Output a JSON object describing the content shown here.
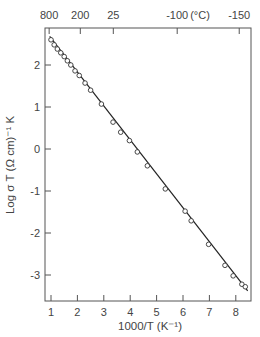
{
  "chart_data": {
    "type": "scatter",
    "title": "",
    "xlabel": "1000/T (K⁻¹)",
    "ylabel": "Log σ T (Ω cm)⁻¹ K",
    "top_xlabel_unit": "(°C)",
    "xlim": [
      0.8,
      8.6
    ],
    "ylim": [
      -3.7,
      2.9
    ],
    "grid": false,
    "legend": null,
    "x_ticks": [
      1,
      2,
      3,
      4,
      5,
      6,
      7,
      8
    ],
    "y_ticks": [
      2,
      1,
      0,
      -1,
      -2,
      -3
    ],
    "top_axis": {
      "label_unit": "(°C)",
      "ticks": [
        {
          "label": "800",
          "x": 0.93
        },
        {
          "label": "200",
          "x": 2.11
        },
        {
          "label": "25",
          "x": 3.36
        },
        {
          "label": "-100",
          "x": 5.78
        },
        {
          "label": "-150",
          "x": 8.13
        }
      ]
    },
    "series": [
      {
        "name": "data",
        "marker": "open-circle",
        "x": [
          1.0,
          1.12,
          1.24,
          1.37,
          1.5,
          1.62,
          1.75,
          1.91,
          2.07,
          2.29,
          2.5,
          2.91,
          3.35,
          3.64,
          3.97,
          4.27,
          4.65,
          5.33,
          6.08,
          6.31,
          6.97,
          7.59,
          7.9,
          8.23,
          8.36
        ],
        "values": [
          2.6,
          2.48,
          2.38,
          2.29,
          2.2,
          2.1,
          2.0,
          1.86,
          1.75,
          1.57,
          1.4,
          1.07,
          0.64,
          0.4,
          0.2,
          -0.07,
          -0.4,
          -0.95,
          -1.48,
          -1.71,
          -2.27,
          -2.77,
          -3.02,
          -3.22,
          -3.28
        ]
      }
    ],
    "fit_line": {
      "x": [
        0.95,
        8.45
      ],
      "y": [
        2.68,
        -3.38
      ]
    }
  }
}
